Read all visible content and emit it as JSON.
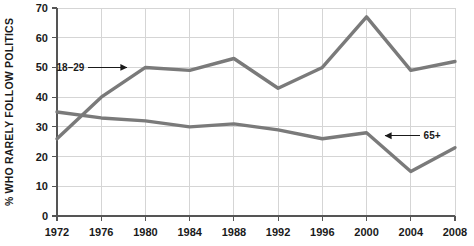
{
  "chart_data": {
    "type": "line",
    "title": "",
    "subtitle": "",
    "xlabel": "",
    "ylabel": "% WHO RARELY FOLLOW POLITICS",
    "x": [
      1972,
      1976,
      1980,
      1984,
      1988,
      1992,
      1996,
      2000,
      2004,
      2008
    ],
    "xtick_labels": [
      "1972",
      "1976",
      "1980",
      "1984",
      "1988",
      "1992",
      "1996",
      "2000",
      "2004",
      "2008"
    ],
    "ytick_labels": [
      "0",
      "10",
      "20",
      "30",
      "40",
      "50",
      "60",
      "70"
    ],
    "yticks": [
      0,
      10,
      20,
      30,
      40,
      50,
      60,
      70
    ],
    "ylim": [
      0,
      70
    ],
    "xlim": [
      1972,
      2008
    ],
    "grid": true,
    "legend_position": "inline-annotations",
    "series": [
      {
        "name": "18–29",
        "color": "#7a7a7a",
        "values": [
          26,
          40,
          50,
          49,
          53,
          43,
          50,
          67,
          49,
          52
        ]
      },
      {
        "name": "65+",
        "color": "#7a7a7a",
        "values": [
          35,
          33,
          32,
          30,
          31,
          29,
          26,
          28,
          15,
          23
        ]
      }
    ],
    "annotations": [
      {
        "text": "18–29",
        "target_x": 1979,
        "target_y": 50,
        "direction": "right"
      },
      {
        "text": "65+",
        "target_x": 2001,
        "target_y": 27,
        "direction": "left"
      }
    ]
  }
}
